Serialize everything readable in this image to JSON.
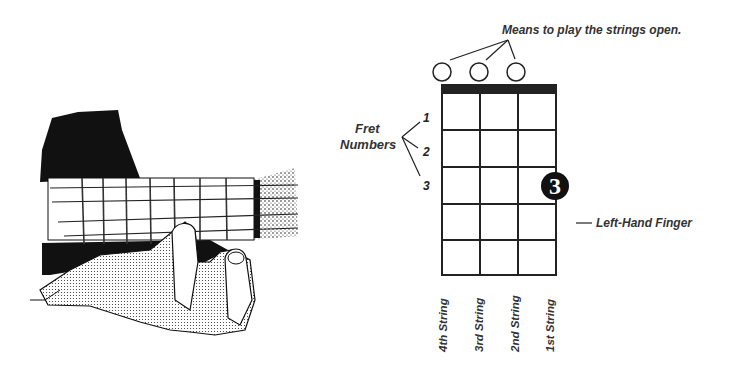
{
  "illustration": {
    "description": "Hand pressing a string on a ukulele fretboard"
  },
  "diagram": {
    "open_strings_label": "Means to play the strings open.",
    "fret_numbers_label_line1": "Fret",
    "fret_numbers_label_line2": "Numbers",
    "fret_numbers": [
      "1",
      "2",
      "3"
    ],
    "left_hand_finger_label": "Left-Hand Finger",
    "finger_number": "3",
    "finger_position": {
      "string": "1st String",
      "fret": 3
    },
    "open_strings": [
      "4th String",
      "3rd String",
      "2nd String"
    ],
    "strings": [
      "4th String",
      "3rd String",
      "2nd String",
      "1st String"
    ],
    "num_frets_shown": 5,
    "colors": {
      "ink": "#111111",
      "text": "#333333",
      "background": "#ffffff"
    }
  }
}
